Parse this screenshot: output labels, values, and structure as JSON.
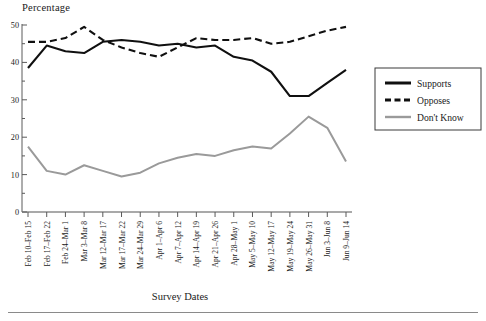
{
  "chart_data": {
    "type": "line",
    "title": "",
    "ylabel": "Percentage",
    "xlabel": "Survey Dates",
    "ylim": [
      0,
      50
    ],
    "yticks": [
      0,
      10,
      20,
      30,
      40,
      50
    ],
    "y_minor_ticks": [
      5,
      15,
      25,
      35,
      45
    ],
    "grid": false,
    "legend_position": "right",
    "categories": [
      "Feb 10–Feb 15",
      "Feb 17–Feb 22",
      "Feb 24–Mar 1",
      "Mar 3–Mar 8",
      "Mar 12–Mar 17",
      "Mar 17–Mar 22",
      "Mar 24–Mar 29",
      "Apr 1–Apr 6",
      "Apr 7–Apr 12",
      "Apr 14–Apr 19",
      "Apr 21–Apr 26",
      "Apr 28–May 1",
      "May 5–May 10",
      "May 12–May 17",
      "May 19–May 24",
      "May 26–May 31",
      "Jun 3–Jun 8",
      "Jun 9–Jun 14"
    ],
    "series": [
      {
        "name": "Supports",
        "style": "solid",
        "color": "#101010",
        "values": [
          38.5,
          44.5,
          43.0,
          42.5,
          45.5,
          46.0,
          45.5,
          44.5,
          45.0,
          44.0,
          44.5,
          41.5,
          40.5,
          37.5,
          31.0,
          31.0,
          34.5,
          38.0
        ]
      },
      {
        "name": "Opposes",
        "style": "dashed",
        "color": "#101010",
        "values": [
          45.5,
          45.5,
          46.5,
          49.5,
          46.0,
          44.0,
          42.5,
          41.5,
          44.0,
          46.5,
          46.0,
          46.0,
          46.5,
          45.0,
          45.5,
          47.0,
          48.5,
          49.5
        ]
      },
      {
        "name": "Don't Know",
        "style": "solid",
        "color": "#9a9a9a",
        "values": [
          17.5,
          11.0,
          10.0,
          12.5,
          11.0,
          9.5,
          10.5,
          13.0,
          14.5,
          15.5,
          15.0,
          16.5,
          17.5,
          17.0,
          21.0,
          25.5,
          22.5,
          13.5
        ]
      }
    ]
  },
  "legend": {
    "items": [
      {
        "label": "Supports"
      },
      {
        "label": "Opposes"
      },
      {
        "label": "Don't Know"
      }
    ]
  }
}
